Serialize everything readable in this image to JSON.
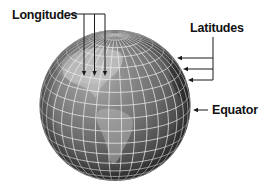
{
  "diagram": {
    "type": "labeled-globe",
    "labels": {
      "longitudes": "Longitudes",
      "latitudes": "Latitudes",
      "equator": "Equator"
    },
    "colors": {
      "background": "#ffffff",
      "globe_light": "#a9a9a9",
      "globe_mid": "#6c6c6c",
      "globe_dark": "#2e2e2e",
      "land": "#c8c8c8",
      "grid": "#ececec",
      "arrow": "#1a1a1a",
      "text": "#111111"
    },
    "globe": {
      "cx": 115,
      "cy": 105.5,
      "r": 75.5,
      "tilt_deg": 20,
      "lat_step_deg": 10,
      "lon_step_deg": 10,
      "lon_offset_deg": 5
    },
    "arrows": {
      "longitudes": {
        "hline_y": 14,
        "hline_x1": 70,
        "hline_x2": 105,
        "xs": [
          84,
          94.5,
          105
        ],
        "tip_y": 76
      },
      "latitudes": {
        "vline_x": 213,
        "vline_y1": 37,
        "ys": [
          58,
          69,
          80
        ],
        "tips_x": [
          177,
          183,
          188
        ]
      },
      "equator": {
        "y": 110,
        "x1": 208,
        "x2": 193
      }
    }
  }
}
